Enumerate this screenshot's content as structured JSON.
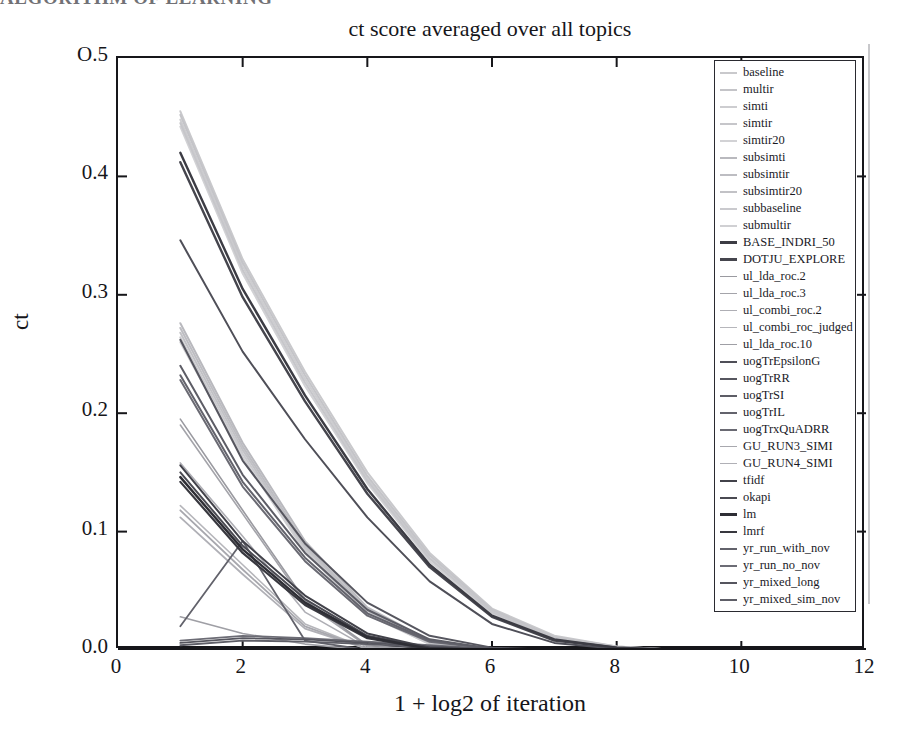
{
  "scan": {
    "cut_header_text": "ALGORITHM OF LEARNING"
  },
  "chart_data": {
    "type": "line",
    "title": "ct score averaged over all topics",
    "xlabel": "1 + log2 of iteration",
    "ylabel": "ct",
    "xlim": [
      0,
      12
    ],
    "ylim": [
      0.0,
      0.5
    ],
    "xticks": [
      "0",
      "2",
      "4",
      "6",
      "8",
      "10",
      "12"
    ],
    "xtick_values": [
      0,
      2,
      4,
      6,
      8,
      10,
      12
    ],
    "yticks": [
      "O.5",
      "0.4",
      "0.3",
      "0.2",
      "0.1",
      "0.0"
    ],
    "ytick_values": [
      0.5,
      0.4,
      0.3,
      0.2,
      0.1,
      0.0
    ],
    "grid": false,
    "legend_position": "top-right-inside",
    "x": [
      1,
      2,
      3,
      4,
      5,
      6,
      7,
      8,
      9,
      10,
      11,
      12
    ],
    "series": [
      {
        "name": "baseline",
        "color": "#c9c9cc",
        "width": 2.0,
        "values": [
          0.455,
          0.33,
          0.235,
          0.15,
          0.082,
          0.035,
          0.012,
          0.003,
          0.0,
          0.0,
          0.0,
          0.0
        ]
      },
      {
        "name": "multir",
        "color": "#c4c4c8",
        "width": 2.0,
        "values": [
          0.452,
          0.327,
          0.232,
          0.147,
          0.08,
          0.034,
          0.011,
          0.003,
          0.0,
          0.0,
          0.0,
          0.0
        ]
      },
      {
        "name": "simti",
        "color": "#cdcdd0",
        "width": 2.0,
        "values": [
          0.448,
          0.324,
          0.229,
          0.145,
          0.078,
          0.033,
          0.011,
          0.002,
          0.0,
          0.0,
          0.0,
          0.0
        ]
      },
      {
        "name": "simtir",
        "color": "#c6c6ca",
        "width": 2.0,
        "values": [
          0.445,
          0.321,
          0.226,
          0.143,
          0.077,
          0.032,
          0.01,
          0.002,
          0.0,
          0.0,
          0.0,
          0.0
        ]
      },
      {
        "name": "simtir20",
        "color": "#d2d2d5",
        "width": 2.0,
        "values": [
          0.442,
          0.318,
          0.223,
          0.141,
          0.075,
          0.031,
          0.01,
          0.002,
          0.0,
          0.0,
          0.0,
          0.0
        ]
      },
      {
        "name": "subsimti",
        "color": "#b9b9be",
        "width": 2.0,
        "values": [
          0.276,
          0.175,
          0.092,
          0.036,
          0.008,
          0.0,
          0.0,
          0.0,
          0.0,
          0.0,
          0.0,
          0.0
        ]
      },
      {
        "name": "subsimtir",
        "color": "#bdbdc2",
        "width": 2.0,
        "values": [
          0.272,
          0.172,
          0.089,
          0.034,
          0.007,
          0.0,
          0.0,
          0.0,
          0.0,
          0.0,
          0.0,
          0.0
        ]
      },
      {
        "name": "subsimtir20",
        "color": "#c2c2c6",
        "width": 2.0,
        "values": [
          0.268,
          0.169,
          0.087,
          0.033,
          0.006,
          0.0,
          0.0,
          0.0,
          0.0,
          0.0,
          0.0,
          0.0
        ]
      },
      {
        "name": "subbaseline",
        "color": "#cacace",
        "width": 2.0,
        "values": [
          0.264,
          0.166,
          0.085,
          0.031,
          0.005,
          0.0,
          0.0,
          0.0,
          0.0,
          0.0,
          0.0,
          0.0
        ]
      },
      {
        "name": "submultir",
        "color": "#d0d0d3",
        "width": 2.0,
        "values": [
          0.26,
          0.163,
          0.083,
          0.03,
          0.005,
          0.0,
          0.0,
          0.0,
          0.0,
          0.0,
          0.0,
          0.0
        ]
      },
      {
        "name": "BASE_INDRI_50",
        "color": "#3c3c44",
        "width": 2.4,
        "values": [
          0.42,
          0.305,
          0.215,
          0.136,
          0.072,
          0.029,
          0.009,
          0.002,
          0.0,
          0.0,
          0.0,
          0.0
        ]
      },
      {
        "name": "DOTJU_EXPLORE",
        "color": "#45454d",
        "width": 2.4,
        "values": [
          0.412,
          0.298,
          0.21,
          0.132,
          0.07,
          0.028,
          0.008,
          0.002,
          0.0,
          0.0,
          0.0,
          0.0
        ]
      },
      {
        "name": "ul_lda_roc.2",
        "color": "#9a9aa0",
        "width": 1.6,
        "values": [
          0.195,
          0.118,
          0.042,
          0.004,
          0.0,
          0.0,
          0.0,
          0.0,
          0.0,
          0.0,
          0.0,
          0.0
        ]
      },
      {
        "name": "ul_lda_roc.3",
        "color": "#a4a4aa",
        "width": 1.6,
        "values": [
          0.19,
          0.115,
          0.04,
          0.003,
          0.0,
          0.0,
          0.0,
          0.0,
          0.0,
          0.0,
          0.0,
          0.0
        ]
      },
      {
        "name": "ul_combi_roc.2",
        "color": "#aeaeb4",
        "width": 1.6,
        "values": [
          0.158,
          0.096,
          0.032,
          0.002,
          0.0,
          0.0,
          0.0,
          0.0,
          0.0,
          0.0,
          0.0,
          0.0
        ]
      },
      {
        "name": "ul_combi_roc_judged",
        "color": "#b6b6bb",
        "width": 1.6,
        "values": [
          0.122,
          0.072,
          0.022,
          0.001,
          0.0,
          0.0,
          0.0,
          0.0,
          0.0,
          0.0,
          0.0,
          0.0
        ]
      },
      {
        "name": "ul_lda_roc.10",
        "color": "#9f9fa5",
        "width": 1.6,
        "values": [
          0.028,
          0.014,
          0.005,
          0.0,
          0.0,
          0.0,
          0.0,
          0.0,
          0.0,
          0.0,
          0.0,
          0.0
        ]
      },
      {
        "name": "uogTrEpsilonG",
        "color": "#4f4f58",
        "width": 2.0,
        "values": [
          0.346,
          0.252,
          0.178,
          0.112,
          0.058,
          0.022,
          0.006,
          0.001,
          0.0,
          0.0,
          0.0,
          0.0
        ]
      },
      {
        "name": "uogTrRR",
        "color": "#56565f",
        "width": 2.0,
        "values": [
          0.262,
          0.16,
          0.09,
          0.04,
          0.012,
          0.002,
          0.0,
          0.0,
          0.0,
          0.0,
          0.0,
          0.0
        ]
      },
      {
        "name": "uogTrSI",
        "color": "#5d5d66",
        "width": 2.0,
        "values": [
          0.24,
          0.148,
          0.082,
          0.034,
          0.009,
          0.001,
          0.0,
          0.0,
          0.0,
          0.0,
          0.0,
          0.0
        ]
      },
      {
        "name": "uogTrIL",
        "color": "#63636c",
        "width": 2.0,
        "values": [
          0.232,
          0.142,
          0.078,
          0.031,
          0.008,
          0.001,
          0.0,
          0.0,
          0.0,
          0.0,
          0.0,
          0.0
        ]
      },
      {
        "name": "uogTrxQuADRR",
        "color": "#6a6a73",
        "width": 2.0,
        "values": [
          0.228,
          0.138,
          0.075,
          0.029,
          0.007,
          0.001,
          0.0,
          0.0,
          0.0,
          0.0,
          0.0,
          0.0
        ]
      },
      {
        "name": "GU_RUN3_SIMI",
        "color": "#a8a8ae",
        "width": 1.8,
        "values": [
          0.118,
          0.068,
          0.02,
          0.001,
          0.0,
          0.0,
          0.0,
          0.0,
          0.0,
          0.0,
          0.0,
          0.0
        ]
      },
      {
        "name": "GU_RUN4_SIMI",
        "color": "#b0b0b6",
        "width": 1.8,
        "values": [
          0.112,
          0.064,
          0.018,
          0.001,
          0.0,
          0.0,
          0.0,
          0.0,
          0.0,
          0.0,
          0.0,
          0.0
        ]
      },
      {
        "name": "tfidf",
        "color": "#42424a",
        "width": 2.0,
        "values": [
          0.156,
          0.092,
          0.046,
          0.014,
          0.002,
          0.0,
          0.0,
          0.0,
          0.0,
          0.0,
          0.0,
          0.0
        ]
      },
      {
        "name": "okapi",
        "color": "#4a4a52",
        "width": 2.0,
        "values": [
          0.15,
          0.088,
          0.043,
          0.012,
          0.002,
          0.0,
          0.0,
          0.0,
          0.0,
          0.0,
          0.0,
          0.0
        ]
      },
      {
        "name": "lm",
        "color": "#2e2e35",
        "width": 2.4,
        "values": [
          0.146,
          0.085,
          0.04,
          0.011,
          0.001,
          0.0,
          0.0,
          0.0,
          0.0,
          0.0,
          0.0,
          0.0
        ]
      },
      {
        "name": "lmrf",
        "color": "#38383f",
        "width": 2.2,
        "values": [
          0.142,
          0.082,
          0.038,
          0.01,
          0.001,
          0.0,
          0.0,
          0.0,
          0.0,
          0.0,
          0.0,
          0.0
        ]
      },
      {
        "name": "yr_run_with_nov",
        "color": "#62626b",
        "width": 1.8,
        "values": [
          0.02,
          0.092,
          0.008,
          0.0,
          0.0,
          0.0,
          0.0,
          0.0,
          0.0,
          0.0,
          0.0,
          0.0
        ]
      },
      {
        "name": "yr_run_no_nov",
        "color": "#6c6c75",
        "width": 1.8,
        "values": [
          0.008,
          0.012,
          0.01,
          0.007,
          0.004,
          0.001,
          0.0,
          0.0,
          0.0,
          0.0,
          0.0,
          0.0
        ]
      },
      {
        "name": "yr_mixed_long",
        "color": "#55555e",
        "width": 1.8,
        "values": [
          0.006,
          0.01,
          0.009,
          0.006,
          0.003,
          0.001,
          0.0,
          0.0,
          0.0,
          0.0,
          0.0,
          0.0
        ]
      },
      {
        "name": "yr_mixed_sim_nov",
        "color": "#5e5e67",
        "width": 1.8,
        "values": [
          0.004,
          0.008,
          0.007,
          0.005,
          0.002,
          0.0,
          0.0,
          0.0,
          0.0,
          0.0,
          0.0,
          0.0
        ]
      }
    ],
    "legend_entries": [
      {
        "label": "baseline",
        "color": "#c9c9cc",
        "weight": 2.0
      },
      {
        "label": "multir",
        "color": "#c4c4c8",
        "weight": 2.0
      },
      {
        "label": "simti",
        "color": "#cdcdd0",
        "weight": 2.0
      },
      {
        "label": "simtir",
        "color": "#c6c6ca",
        "weight": 2.0
      },
      {
        "label": "simtir20",
        "color": "#d2d2d5",
        "weight": 2.0
      },
      {
        "label": "subsimti",
        "color": "#b9b9be",
        "weight": 2.0
      },
      {
        "label": "subsimtir",
        "color": "#bdbdc2",
        "weight": 2.0
      },
      {
        "label": "subsimtir20",
        "color": "#c2c2c6",
        "weight": 2.0
      },
      {
        "label": "subbaseline",
        "color": "#cacace",
        "weight": 2.0
      },
      {
        "label": "submultir",
        "color": "#d0d0d3",
        "weight": 2.0
      },
      {
        "label": "BASE_INDRI_50",
        "color": "#3c3c44",
        "weight": 3.0
      },
      {
        "label": "DOTJU_EXPLORE",
        "color": "#45454d",
        "weight": 3.0
      },
      {
        "label": "ul_lda_roc.2",
        "color": "#9a9aa0",
        "weight": 1.6
      },
      {
        "label": "ul_lda_roc.3",
        "color": "#a4a4aa",
        "weight": 1.6
      },
      {
        "label": "ul_combi_roc.2",
        "color": "#aeaeb4",
        "weight": 1.6
      },
      {
        "label": "ul_combi_roc_judged",
        "color": "#b6b6bb",
        "weight": 1.6
      },
      {
        "label": "ul_lda_roc.10",
        "color": "#9f9fa5",
        "weight": 1.6
      },
      {
        "label": "uogTrEpsilonG",
        "color": "#4f4f58",
        "weight": 2.6
      },
      {
        "label": "uogTrRR",
        "color": "#56565f",
        "weight": 2.6
      },
      {
        "label": "uogTrSI",
        "color": "#5d5d66",
        "weight": 2.6
      },
      {
        "label": "uogTrIL",
        "color": "#63636c",
        "weight": 2.6
      },
      {
        "label": "uogTrxQuADRR",
        "color": "#6a6a73",
        "weight": 2.6
      },
      {
        "label": "GU_RUN3_SIMI",
        "color": "#a8a8ae",
        "weight": 1.8
      },
      {
        "label": "GU_RUN4_SIMI",
        "color": "#b0b0b6",
        "weight": 1.8
      },
      {
        "label": "tfidf",
        "color": "#42424a",
        "weight": 2.6
      },
      {
        "label": "okapi",
        "color": "#4a4a52",
        "weight": 2.6
      },
      {
        "label": "lm",
        "color": "#2e2e35",
        "weight": 3.0
      },
      {
        "label": "lmrf",
        "color": "#38383f",
        "weight": 2.8
      },
      {
        "label": "yr_run_with_nov",
        "color": "#62626b",
        "weight": 2.0
      },
      {
        "label": "yr_run_no_nov",
        "color": "#6c6c75",
        "weight": 2.0
      },
      {
        "label": "yr_mixed_long",
        "color": "#55555e",
        "weight": 2.0
      },
      {
        "label": "yr_mixed_sim_nov",
        "color": "#5e5e67",
        "weight": 2.0
      }
    ]
  }
}
